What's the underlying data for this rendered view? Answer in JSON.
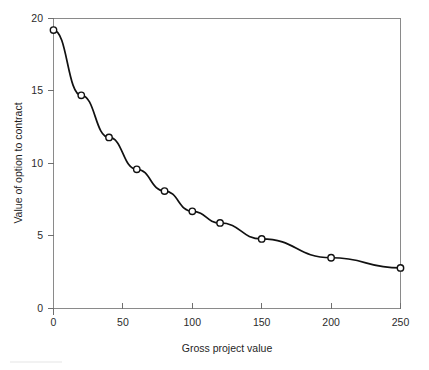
{
  "chart_data": {
    "type": "line",
    "title": "",
    "subtitle": "",
    "xlabel": "Gross project value",
    "ylabel": "Value of option to contract",
    "xlim": [
      0,
      250
    ],
    "ylim": [
      0,
      20
    ],
    "xticks": [
      0,
      50,
      100,
      150,
      200,
      250
    ],
    "yticks": [
      0,
      5,
      10,
      15,
      20
    ],
    "xtick_labels": [
      "0",
      "50",
      "100",
      "150",
      "200",
      "250"
    ],
    "ytick_labels": [
      "0",
      "5",
      "10",
      "15",
      "20"
    ],
    "grid": false,
    "legend": false,
    "legend_position": "none",
    "marker": "open-circle",
    "line_color": "#111111",
    "marker_face_color": "#ffffff",
    "marker_edge_color": "#111111",
    "series": [
      {
        "name": "Value of option to contract",
        "x": [
          0,
          20,
          40,
          60,
          80,
          100,
          120,
          150,
          200,
          250
        ],
        "values": [
          19.2,
          14.7,
          11.8,
          9.6,
          8.1,
          6.7,
          5.9,
          4.8,
          3.5,
          2.8
        ],
        "points": [
          {
            "x": 0,
            "y": 19.2
          },
          {
            "x": 20,
            "y": 14.7
          },
          {
            "x": 40,
            "y": 11.8
          },
          {
            "x": 60,
            "y": 9.6
          },
          {
            "x": 80,
            "y": 8.1
          },
          {
            "x": 100,
            "y": 6.7
          },
          {
            "x": 120,
            "y": 5.9
          },
          {
            "x": 150,
            "y": 4.8
          },
          {
            "x": 200,
            "y": 3.5
          },
          {
            "x": 250,
            "y": 2.8
          }
        ]
      }
    ]
  },
  "axes": {
    "x_title": "Gross project value",
    "y_title": "Value of option to contract"
  },
  "ticks": {
    "x": [
      "0",
      "50",
      "100",
      "150",
      "200",
      "250"
    ],
    "y": [
      "0",
      "5",
      "10",
      "15",
      "20"
    ]
  }
}
